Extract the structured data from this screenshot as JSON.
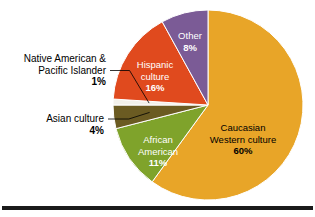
{
  "chart_data": {
    "type": "pie",
    "title": "",
    "subtitle": "",
    "xlabel": "",
    "ylabel": "",
    "legend_position": "none",
    "grid": false,
    "units": "percent",
    "total": 100,
    "categories": [
      "Caucasian Western culture",
      "African American",
      "Asian culture",
      "Native American & Pacific Islander",
      "Hispanic culture",
      "Other"
    ],
    "values": [
      60,
      11,
      4,
      1,
      16,
      8
    ],
    "slices": [
      {
        "id": "caucasian",
        "label_line1": "Caucasian",
        "label_line2": "Western culture",
        "percent_text": "60%",
        "value": 60,
        "color": "#E8A528",
        "label_color": "#000000",
        "label_placement": "inside",
        "label_x": 243,
        "label_y": 128
      },
      {
        "id": "african-american",
        "label_line1": "African",
        "label_line2": "American",
        "percent_text": "11%",
        "value": 11,
        "color": "#7FA32B",
        "label_color": "#FFFFFF",
        "label_placement": "inside",
        "label_x": 158,
        "label_y": 140
      },
      {
        "id": "asian",
        "label_line1": "Asian culture",
        "label_line2": "",
        "percent_text": "4%",
        "value": 4,
        "color": "#6B5B22",
        "label_color": "#000000",
        "label_placement": "callout",
        "label_x": 104,
        "label_y": 122
      },
      {
        "id": "native-american",
        "label_line1": "Native American &",
        "label_line2": "Pacific Islander",
        "percent_text": "1%",
        "value": 1,
        "color": "#F2F0EA",
        "label_color": "#000000",
        "label_placement": "callout",
        "label_x": 106,
        "label_y": 62
      },
      {
        "id": "hispanic",
        "label_line1": "Hispanic",
        "label_line2": "culture",
        "percent_text": "16%",
        "value": 16,
        "color": "#E04A1E",
        "label_color": "#FFFFFF",
        "label_placement": "inside",
        "label_x": 155,
        "label_y": 65
      },
      {
        "id": "other",
        "label_line1": "Other",
        "label_line2": "",
        "percent_text": "8%",
        "value": 8,
        "color": "#7B5B96",
        "label_color": "#FFFFFF",
        "label_placement": "inside",
        "label_x": 190,
        "label_y": 36
      }
    ],
    "geometry": {
      "center_x": 208,
      "center_y": 105,
      "radius": 95,
      "start_angle_deg": 0,
      "direction": "clockwise"
    }
  },
  "figure": {
    "background_color": "#ffffff",
    "rule_color": "#1a1a1a"
  }
}
